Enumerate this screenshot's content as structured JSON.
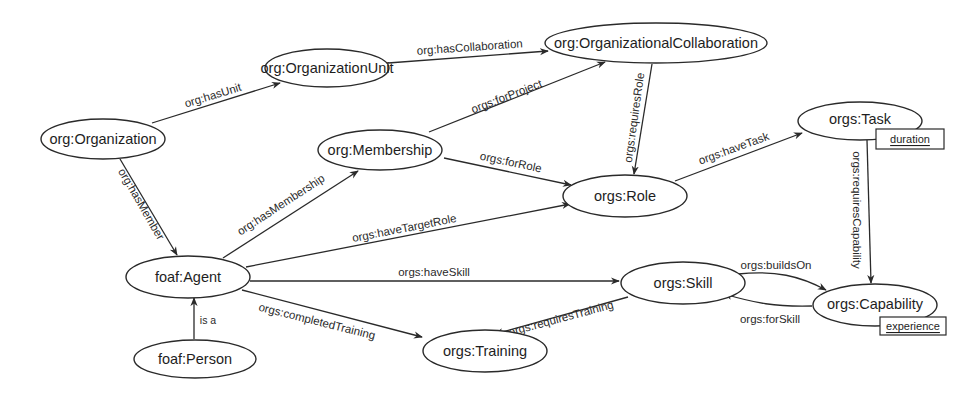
{
  "diagram": {
    "type": "ontology-graph",
    "nodes": {
      "organization": {
        "label": "org:Organization"
      },
      "organization_unit": {
        "label": "org:OrganizationUnit"
      },
      "organizational_collaboration": {
        "label": "org:OrganizationalCollaboration"
      },
      "membership": {
        "label": "org:Membership"
      },
      "role": {
        "label": "orgs:Role"
      },
      "task": {
        "label": "orgs:Task",
        "attribute": "duration"
      },
      "agent": {
        "label": "foaf:Agent"
      },
      "person": {
        "label": "foaf:Person"
      },
      "skill": {
        "label": "orgs:Skill"
      },
      "training": {
        "label": "orgs:Training"
      },
      "capability": {
        "label": "orgs:Capability",
        "attribute": "experience"
      }
    },
    "edges": {
      "has_unit": {
        "label": "org:hasUnit",
        "from": "org:Organization",
        "to": "org:OrganizationUnit"
      },
      "has_collaboration": {
        "label": "org:hasCollaboration",
        "from": "org:OrganizationUnit",
        "to": "org:OrganizationalCollaboration"
      },
      "for_project": {
        "label": "orgs:forProject",
        "from": "org:Membership",
        "to": "org:OrganizationalCollaboration"
      },
      "requires_role": {
        "label": "orgs:requiresRole",
        "from": "org:OrganizationalCollaboration",
        "to": "orgs:Role"
      },
      "has_member": {
        "label": "org:hasMember",
        "from": "org:Organization",
        "to": "foaf:Agent"
      },
      "has_membership": {
        "label": "org:hasMembership",
        "from": "foaf:Agent",
        "to": "org:Membership"
      },
      "for_role": {
        "label": "orgs:forRole",
        "from": "org:Membership",
        "to": "orgs:Role"
      },
      "have_target_role": {
        "label": "orgs:haveTargetRole",
        "from": "foaf:Agent",
        "to": "orgs:Role"
      },
      "have_task": {
        "label": "orgs:haveTask",
        "from": "orgs:Role",
        "to": "orgs:Task"
      },
      "requires_capability": {
        "label": "orgs:requiresCapability",
        "from": "orgs:Task",
        "to": "orgs:Capability"
      },
      "have_skill": {
        "label": "orgs:haveSkill",
        "from": "foaf:Agent",
        "to": "orgs:Skill"
      },
      "builds_on": {
        "label": "orgs:buildsOn",
        "from": "orgs:Skill",
        "to": "orgs:Capability"
      },
      "for_skill": {
        "label": "orgs:forSkill",
        "from": "orgs:Capability",
        "to": "orgs:Skill"
      },
      "completed_training": {
        "label": "orgs:completedTraining",
        "from": "foaf:Agent",
        "to": "orgs:Training"
      },
      "requires_training": {
        "label": "orgs:requiresTraining",
        "from": "orgs:Skill",
        "to": "orgs:Training"
      },
      "is_a": {
        "label": "is a",
        "from": "foaf:Person",
        "to": "foaf:Agent"
      }
    }
  }
}
